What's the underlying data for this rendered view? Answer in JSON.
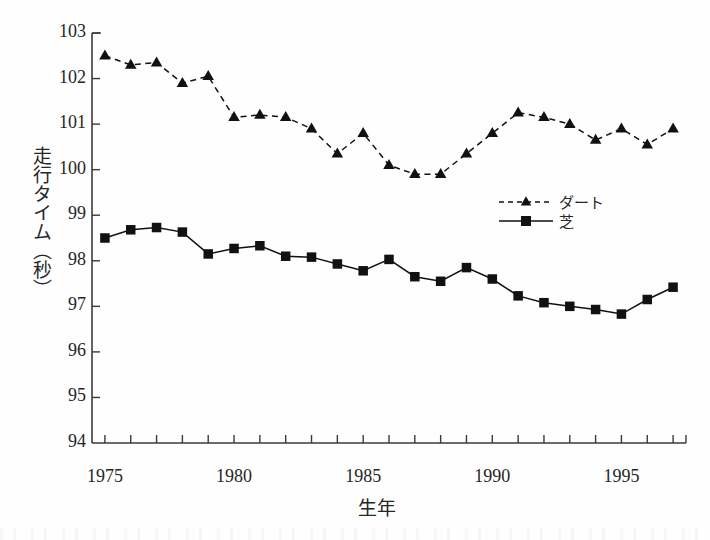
{
  "chart_data": {
    "type": "line",
    "title": "",
    "xlabel": "生年",
    "ylabel": "走行タイム（秒）",
    "xlim": [
      1974.5,
      1997.5
    ],
    "ylim": [
      94,
      103
    ],
    "grid": false,
    "legend_position": "center-right",
    "x": [
      1975,
      1976,
      1977,
      1978,
      1979,
      1980,
      1981,
      1982,
      1983,
      1984,
      1985,
      1986,
      1987,
      1988,
      1989,
      1990,
      1991,
      1992,
      1993,
      1994,
      1995,
      1996,
      1997
    ],
    "xticks": [
      1975,
      1980,
      1985,
      1990,
      1995
    ],
    "xtick_labels": [
      "1975",
      "1980",
      "1985",
      "1990",
      "1995"
    ],
    "yticks": [
      94,
      95,
      96,
      97,
      98,
      99,
      100,
      101,
      102,
      103
    ],
    "ytick_labels": [
      "94",
      "95",
      "96",
      "97",
      "98",
      "99",
      "100",
      "101",
      "102",
      "103"
    ],
    "series": [
      {
        "name": "ダート",
        "marker": "triangle",
        "linestyle": "dashed",
        "color": "#111111",
        "values": [
          102.5,
          102.3,
          102.35,
          101.9,
          102.05,
          101.15,
          101.2,
          101.15,
          100.9,
          100.35,
          100.8,
          100.1,
          99.9,
          99.9,
          100.35,
          100.8,
          101.25,
          101.15,
          101.0,
          100.65,
          100.9,
          100.55,
          100.9
        ]
      },
      {
        "name": "芝",
        "marker": "square",
        "linestyle": "solid",
        "color": "#111111",
        "values": [
          98.5,
          98.68,
          98.73,
          98.63,
          98.15,
          98.27,
          98.33,
          98.1,
          98.08,
          97.93,
          97.78,
          98.03,
          97.65,
          97.55,
          97.85,
          97.6,
          97.23,
          97.08,
          97.0,
          96.93,
          96.83,
          97.15,
          97.42
        ]
      }
    ]
  },
  "legend": {
    "items": [
      {
        "label": "ダート",
        "marker": "triangle",
        "linestyle": "dashed"
      },
      {
        "label": "芝",
        "marker": "square",
        "linestyle": "solid"
      }
    ]
  },
  "axes": {
    "x_title": "生年",
    "y_title": "走行タイム（秒）"
  }
}
